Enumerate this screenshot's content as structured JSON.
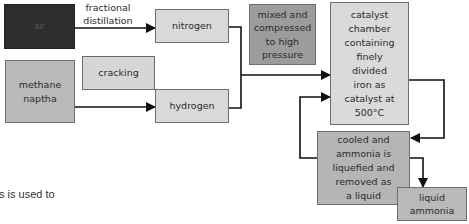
{
  "diagram": {
    "nodes": {
      "air": {
        "label": "air",
        "fill": "#2e2e2e"
      },
      "nitrogen": {
        "label": "nitrogen",
        "fill": "#d9d9d9"
      },
      "methane": {
        "label": "methane\nnaptha",
        "fill": "#b9b9b9"
      },
      "cracking": {
        "label": "cracking",
        "fill": "#d6d6d6"
      },
      "hydrogen": {
        "label": "hydrogen",
        "fill": "#d9d9d9"
      },
      "mixed": {
        "label": "mixed and\ncompressed\nto high\npressure",
        "fill": "#9c9c9c"
      },
      "catalyst": {
        "label": "catalyst\nchamber\ncontaining\nfinely\ndivided\niron as\ncatalyst at\n500°C",
        "fill": "#dadada"
      },
      "cooled": {
        "label": "cooled and\nammonia is\nliquefied and\nremoved as\na liquid",
        "fill": "#b5b5b5"
      },
      "liquid_ammonia": {
        "label": "liquid\nammonia",
        "fill": "#b9b9b9"
      }
    },
    "edge_labels": {
      "fractional_distillation": "fractional\ndistillation"
    }
  },
  "caption": {
    "text": "s is used to"
  }
}
